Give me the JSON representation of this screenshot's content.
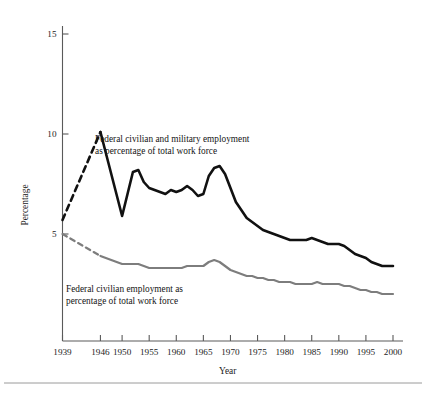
{
  "figure": {
    "background_color": "#ffffff",
    "width": 426,
    "height": 396,
    "bottom_rule_color": "#9a9a9a"
  },
  "axes": {
    "x_title": "Year",
    "y_title": "Percentage",
    "x_tick_labels": [
      "1939",
      "1946",
      "1950",
      "1955",
      "1960",
      "1965",
      "1970",
      "1975",
      "1980",
      "1985",
      "1990",
      "1995",
      "2000"
    ],
    "y_tick_labels": [
      "15",
      "10",
      "5"
    ],
    "axis_color": "#5a5a5a"
  },
  "annotations": {
    "total_line_1": "Federal civilian and military employment",
    "total_line_2": "as percentage of total work force",
    "civilian_line_1": "Federal civilian employment as",
    "civilian_line_2": "percentage of total work force"
  },
  "chart_data": {
    "type": "line",
    "title": "",
    "xlabel": "Year",
    "ylabel": "Percentage",
    "xlim": [
      1939,
      2001
    ],
    "ylim": [
      1.35,
      16.0
    ],
    "grid": false,
    "legend": "inline-annotations",
    "yticks": [
      5,
      10,
      15
    ],
    "xticks": [
      1939,
      1946,
      1950,
      1955,
      1960,
      1965,
      1970,
      1975,
      1980,
      1985,
      1990,
      1995,
      2000
    ],
    "series": [
      {
        "name": "Federal civilian and military employment as percentage of total work force",
        "color": "#111111",
        "stroke_width": 2.6,
        "dashed_segment_years": [
          1939,
          1946
        ],
        "x": [
          1939,
          1946,
          1950,
          1951,
          1952,
          1953,
          1954,
          1955,
          1956,
          1957,
          1958,
          1959,
          1960,
          1961,
          1962,
          1963,
          1964,
          1965,
          1966,
          1967,
          1968,
          1969,
          1970,
          1971,
          1972,
          1973,
          1974,
          1975,
          1976,
          1977,
          1978,
          1979,
          1980,
          1981,
          1982,
          1983,
          1984,
          1985,
          1986,
          1987,
          1988,
          1989,
          1990,
          1991,
          1992,
          1993,
          1994,
          1995,
          1996,
          1997,
          1998,
          1999,
          2000
        ],
        "y": [
          5.7,
          10.1,
          5.9,
          7.0,
          8.1,
          8.2,
          7.6,
          7.3,
          7.2,
          7.1,
          7.0,
          7.2,
          7.1,
          7.2,
          7.4,
          7.2,
          6.9,
          7.0,
          7.9,
          8.3,
          8.4,
          8.0,
          7.3,
          6.6,
          6.2,
          5.8,
          5.6,
          5.4,
          5.2,
          5.1,
          5.0,
          4.9,
          4.8,
          4.7,
          4.7,
          4.7,
          4.7,
          4.8,
          4.7,
          4.6,
          4.5,
          4.5,
          4.5,
          4.4,
          4.2,
          4.0,
          3.9,
          3.8,
          3.6,
          3.5,
          3.4,
          3.4,
          3.4
        ]
      },
      {
        "name": "Federal civilian employment as percentage of total work force",
        "color": "#7d7d7d",
        "stroke_width": 2.2,
        "dashed_segment_years": [
          1939,
          1946
        ],
        "x": [
          1939,
          1946,
          1950,
          1951,
          1952,
          1953,
          1954,
          1955,
          1956,
          1957,
          1958,
          1959,
          1960,
          1961,
          1962,
          1963,
          1964,
          1965,
          1966,
          1967,
          1968,
          1969,
          1970,
          1971,
          1972,
          1973,
          1974,
          1975,
          1976,
          1977,
          1978,
          1979,
          1980,
          1981,
          1982,
          1983,
          1984,
          1985,
          1986,
          1987,
          1988,
          1989,
          1990,
          1991,
          1992,
          1993,
          1994,
          1995,
          1996,
          1997,
          1998,
          1999,
          2000
        ],
        "y": [
          5.0,
          3.9,
          3.5,
          3.5,
          3.5,
          3.5,
          3.4,
          3.3,
          3.3,
          3.3,
          3.3,
          3.3,
          3.3,
          3.3,
          3.4,
          3.4,
          3.4,
          3.4,
          3.6,
          3.7,
          3.6,
          3.4,
          3.2,
          3.1,
          3.0,
          2.9,
          2.9,
          2.8,
          2.8,
          2.7,
          2.7,
          2.6,
          2.6,
          2.6,
          2.5,
          2.5,
          2.5,
          2.5,
          2.6,
          2.5,
          2.5,
          2.5,
          2.5,
          2.4,
          2.4,
          2.3,
          2.2,
          2.2,
          2.1,
          2.1,
          2.0,
          2.0,
          2.0
        ]
      }
    ]
  }
}
